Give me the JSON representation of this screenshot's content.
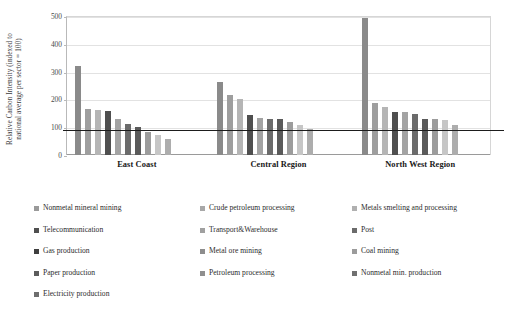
{
  "chart_data": {
    "type": "bar",
    "title": "",
    "xlabel": "",
    "ylabel": "Relative Carbon Intensity (indexed to national average per sector = 100)",
    "ylabel_line1": "Relative Carbon Intensity (indexed to",
    "ylabel_line2": "national average per sector = 100)",
    "ylim": [
      0,
      500
    ],
    "yticks": [
      0,
      100,
      200,
      300,
      400,
      500
    ],
    "ytick_labels": [
      "0",
      "100",
      "200",
      "300",
      "400",
      "500"
    ],
    "grid": true,
    "legend_position": "bottom",
    "reference_line": {
      "value": 93,
      "label": ""
    },
    "categories": [
      "East Coast",
      "Central Region",
      "North West Region"
    ],
    "series": [
      {
        "name": "Nonmetal mineral  mining",
        "color": "#8a8a8a",
        "values": [
          320,
          263,
          492
        ]
      },
      {
        "name": "Crude petroleum processing",
        "color": "#9e9e9e",
        "values": [
          165,
          215,
          186
        ]
      },
      {
        "name": "Metals smelting and processing",
        "color": "#b5b5b5",
        "values": [
          161,
          203,
          174
        ]
      },
      {
        "name": "Telecommunication",
        "color": "#4f4f4f",
        "values": [
          160,
          143,
          154
        ]
      },
      {
        "name": "Transport&Warehouse",
        "color": "#a3a3a3",
        "values": [
          129,
          134,
          153
        ]
      },
      {
        "name": "Post",
        "color": "#6b6b6b",
        "values": [
          110,
          131,
          148
        ]
      },
      {
        "name": "Gas production",
        "color": "#5a5a5a",
        "values": [
          101,
          130,
          129
        ]
      },
      {
        "name": "Metal ore mining",
        "color": "#9c9c9c",
        "values": [
          81,
          118,
          128
        ]
      },
      {
        "name": "Coal mining",
        "color": "#c6c6c6",
        "values": [
          72,
          108,
          125
        ]
      },
      {
        "name": "Paper production",
        "color": "#adadad",
        "values": [
          56,
          94,
          108
        ]
      },
      {
        "name": "Petroleum processing",
        "color": "#8f8f8f",
        "values": [
          null,
          null,
          null
        ]
      },
      {
        "name": "Nonmetal min. production",
        "color": "#707070",
        "values": [
          null,
          null,
          null
        ]
      },
      {
        "name": "Electricity production",
        "color": "#7d7d7d",
        "values": [
          null,
          null,
          null
        ]
      }
    ]
  },
  "legend": {
    "columns": [
      [
        {
          "label": "Nonmetal mineral  mining",
          "color": "#9a9a9a"
        },
        {
          "label": "Telecommunication",
          "color": "#4f4f4f"
        },
        {
          "label": "Gas production",
          "color": "#3f3f3f"
        },
        {
          "label": "Paper production",
          "color": "#5c5c5c"
        },
        {
          "label": "Electricity production",
          "color": "#6e6e6e"
        }
      ],
      [
        {
          "label": "Crude petroleum processing",
          "color": "#a8a8a8"
        },
        {
          "label": "Transport&Warehouse",
          "color": "#a0a0a0"
        },
        {
          "label": "Metal ore mining",
          "color": "#8d8d8d"
        },
        {
          "label": "Petroleum processing",
          "color": "#8f8f8f"
        }
      ],
      [
        {
          "label": "Metals smelting and processing",
          "color": "#b0b0b0"
        },
        {
          "label": "Post",
          "color": "#6b6b6b"
        },
        {
          "label": "Coal mining",
          "color": "#9b9b9b"
        },
        {
          "label": "Nonmetal min. production",
          "color": "#707070"
        }
      ]
    ]
  }
}
